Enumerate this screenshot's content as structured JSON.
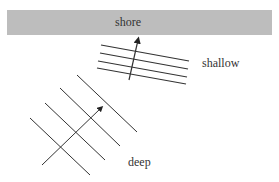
{
  "diagram": {
    "labels": {
      "shore": "shore",
      "shallow": "shallow",
      "deep": "deep"
    },
    "colors": {
      "shore_band": "#bdbdbd",
      "lines": "#333333",
      "text": "#333333"
    },
    "wavefronts": {
      "shallow_count": 4,
      "deep_count": 4
    },
    "arrows": {
      "shallow_direction": "toward shore (nearly vertical)",
      "deep_direction": "diagonal toward upper right"
    }
  }
}
